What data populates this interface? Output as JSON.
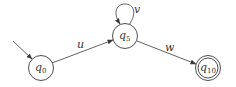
{
  "diagram": {
    "type": "finite-automaton",
    "states": [
      {
        "id": "q0",
        "base": "q",
        "sub": "0",
        "initial": true,
        "accepting": false
      },
      {
        "id": "q5",
        "base": "q",
        "sub": "5",
        "initial": false,
        "accepting": false
      },
      {
        "id": "q10",
        "base": "q",
        "sub": "10",
        "initial": false,
        "accepting": true
      }
    ],
    "transitions": [
      {
        "from": "q0",
        "to": "q5",
        "label": "u"
      },
      {
        "from": "q5",
        "to": "q5",
        "label": "v"
      },
      {
        "from": "q5",
        "to": "q10",
        "label": "w"
      }
    ]
  },
  "colors": {
    "stroke": "#3a3a3a",
    "background": "#ffffff"
  }
}
